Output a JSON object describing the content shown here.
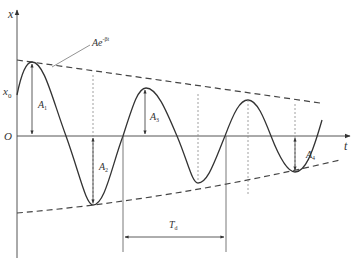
{
  "diagram": {
    "colors": {
      "curve": "#333333",
      "axis": "#555555",
      "envelope": "#444444",
      "guide": "#888888"
    },
    "axes": {
      "y_label": "x",
      "x_label": "t",
      "origin_label": "O",
      "x0_label": "x",
      "x0_sub": "0"
    },
    "envelope": {
      "label": "Ae",
      "label_sup": "-βt"
    },
    "amplitudes": [
      {
        "label": "A",
        "sub": "1"
      },
      {
        "label": "A",
        "sub": "2"
      },
      {
        "label": "A",
        "sub": "3"
      },
      {
        "label": "A",
        "sub": "4"
      }
    ],
    "period": {
      "label": "T",
      "sub": "d"
    }
  }
}
